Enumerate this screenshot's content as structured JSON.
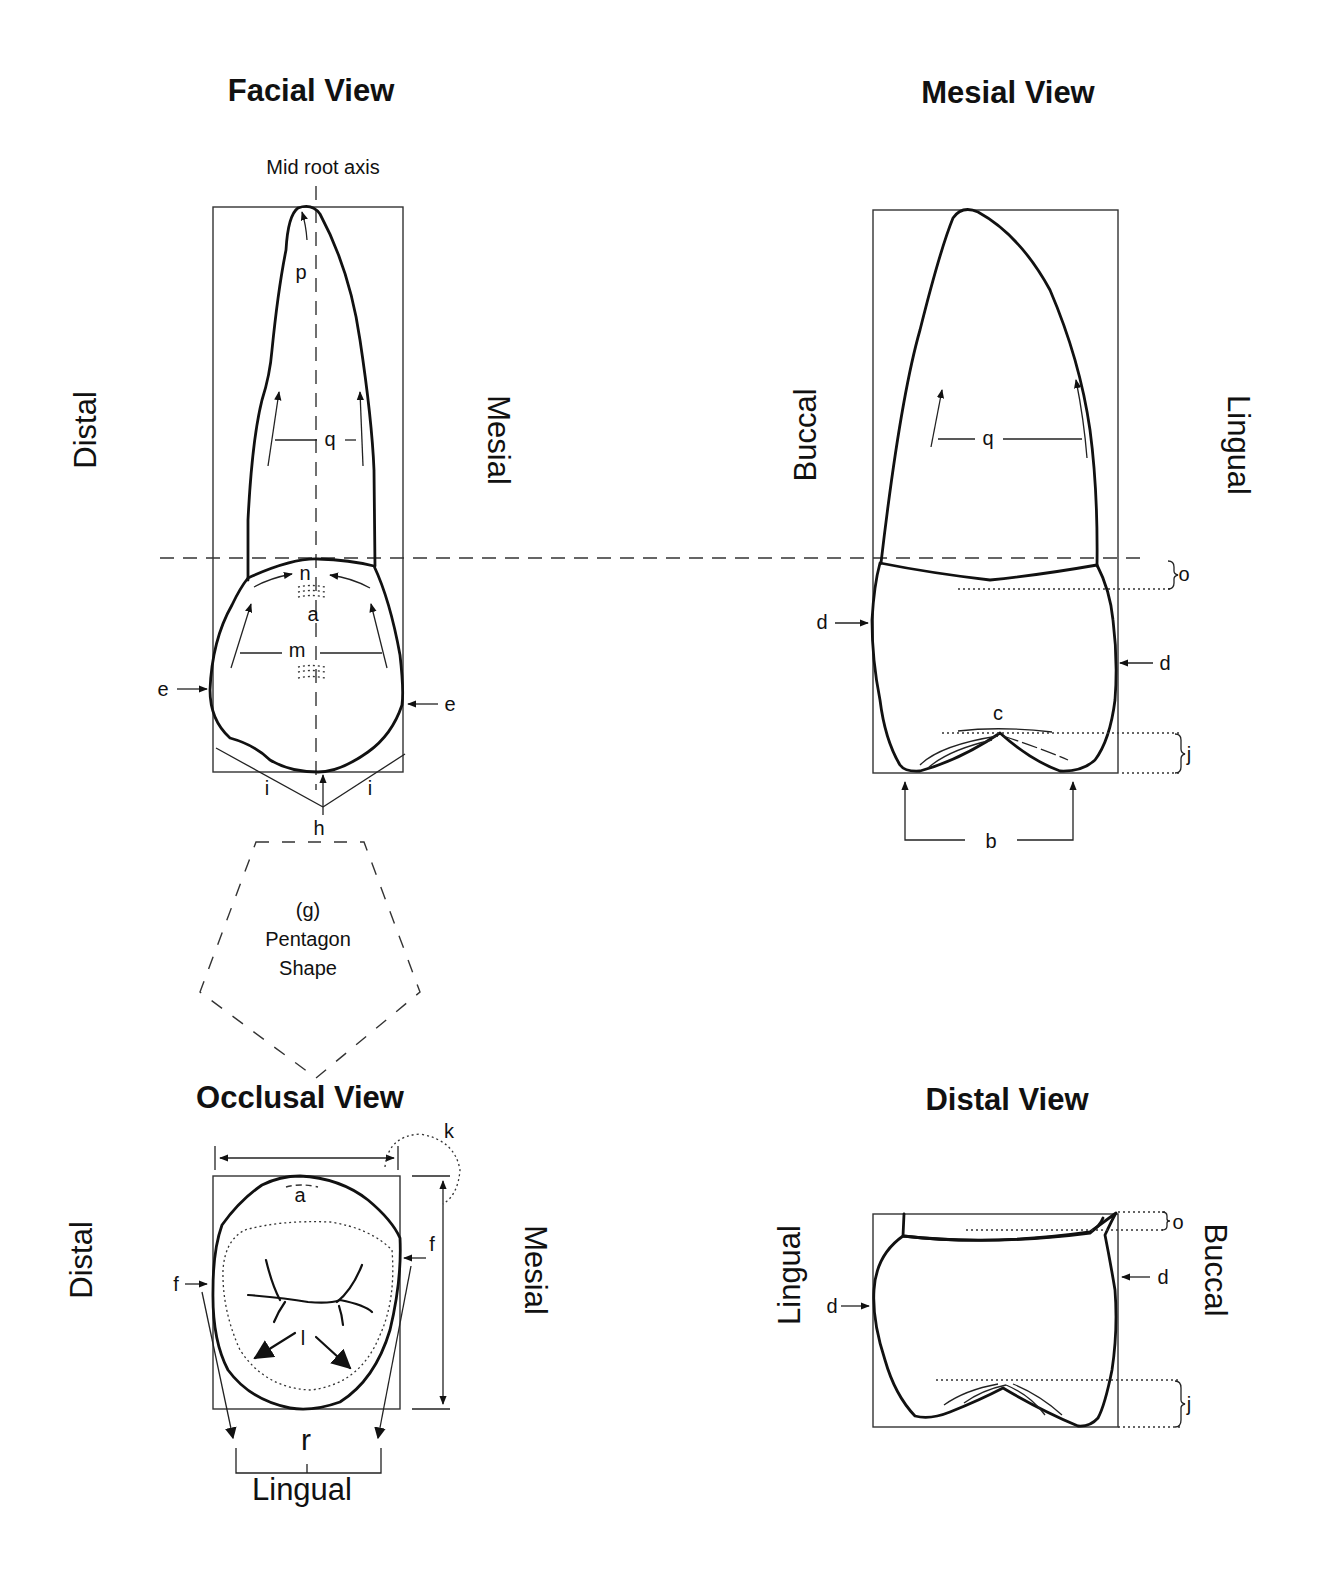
{
  "figure": {
    "views": {
      "facial": {
        "title": "Facial View",
        "axis_label": "Mid root axis",
        "left_side": "Distal",
        "right_side": "Mesial",
        "labels": {
          "p": "p",
          "q": "q",
          "n": "n",
          "a": "a",
          "m": "m",
          "e_left": "e",
          "e_right": "e",
          "i_left": "i",
          "i_right": "i",
          "h": "h"
        }
      },
      "pentagon": {
        "line1": "(g)",
        "line2": "Pentagon",
        "line3": "Shape"
      },
      "mesial": {
        "title": "Mesial View",
        "left_side": "Buccal",
        "right_side": "Lingual",
        "labels": {
          "q": "q",
          "o": "o",
          "d_left": "d",
          "d_right": "d",
          "c": "c",
          "j": "j",
          "b": "b"
        }
      },
      "occlusal": {
        "title": "Occlusal View",
        "left_side": "Distal",
        "right_side": "Mesial",
        "bottom_side": "Lingual",
        "labels": {
          "k": "k",
          "a": "a",
          "f_left": "f",
          "f_right": "f",
          "l": "l",
          "r": "r"
        }
      },
      "distal": {
        "title": "Distal View",
        "left_side": "Lingual",
        "right_side": "Buccal",
        "labels": {
          "o": "o",
          "d_left": "d",
          "d_right": "d",
          "j": "j"
        }
      }
    },
    "colors": {
      "ink": "#111111",
      "background": "#ffffff"
    }
  }
}
